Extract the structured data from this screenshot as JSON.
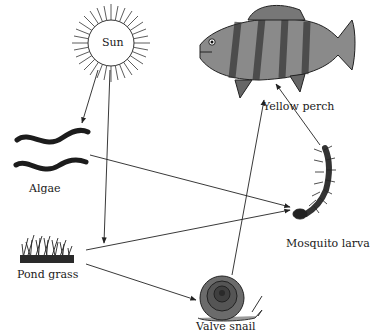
{
  "diagram": {
    "type": "food-web",
    "nodes": [
      {
        "id": "sun",
        "label": "Sun"
      },
      {
        "id": "algae",
        "label": "Algae"
      },
      {
        "id": "pond_grass",
        "label": "Pond grass"
      },
      {
        "id": "valve_snail",
        "label": "Valve snail"
      },
      {
        "id": "mosquito_larva",
        "label": "Mosquito larva"
      },
      {
        "id": "yellow_perch",
        "label": "Yellow perch"
      }
    ],
    "edges": [
      {
        "from": "sun",
        "to": "algae"
      },
      {
        "from": "sun",
        "to": "pond_grass"
      },
      {
        "from": "algae",
        "to": "mosquito_larva"
      },
      {
        "from": "pond_grass",
        "to": "mosquito_larva"
      },
      {
        "from": "pond_grass",
        "to": "valve_snail"
      },
      {
        "from": "valve_snail",
        "to": "yellow_perch"
      },
      {
        "from": "mosquito_larva",
        "to": "yellow_perch"
      }
    ]
  }
}
